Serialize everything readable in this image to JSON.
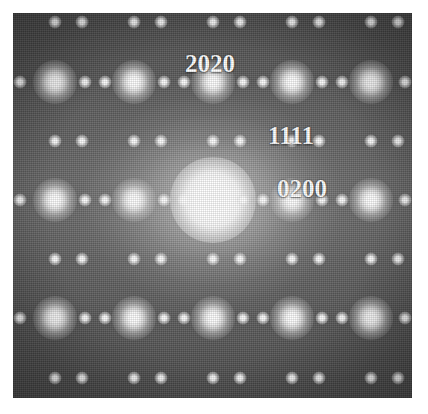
{
  "figure": {
    "kind": "electron-diffraction-pattern",
    "plate": {
      "left": 13,
      "top": 13,
      "width": 399,
      "height": 385,
      "background_color": "#4b4b4b",
      "spot_color": "#ffffff",
      "border_color": "#ffffff"
    },
    "center_beam": {
      "x": 200,
      "y": 187,
      "label": "transmitted-beam"
    }
  },
  "labels": [
    {
      "text": "2020",
      "x": 197,
      "y": 50
    },
    {
      "text": "1111",
      "x": 278,
      "y": 122
    },
    {
      "text": "0200",
      "x": 289,
      "y": 175
    }
  ],
  "chart_data": {
    "type": "scatter",
    "title": "",
    "xlabel": "",
    "ylabel": "",
    "grid": false,
    "legend": "none",
    "note": "Reciprocal-lattice reflections. Coordinates are plate-relative pixels; 'size' encodes relative spot intensity.",
    "row_spacing": 59,
    "column_spacing": 79,
    "spots": [
      {
        "x": 42,
        "y": 9,
        "size": "sm"
      },
      {
        "x": 69,
        "y": 9,
        "size": "sm"
      },
      {
        "x": 121,
        "y": 9,
        "size": "sm"
      },
      {
        "x": 148,
        "y": 9,
        "size": "sm"
      },
      {
        "x": 200,
        "y": 9,
        "size": "sm"
      },
      {
        "x": 227,
        "y": 9,
        "size": "sm"
      },
      {
        "x": 279,
        "y": 9,
        "size": "sm"
      },
      {
        "x": 306,
        "y": 9,
        "size": "sm"
      },
      {
        "x": 358,
        "y": 9,
        "size": "sm"
      },
      {
        "x": 385,
        "y": 9,
        "size": "sm"
      },
      {
        "x": 7,
        "y": 69,
        "size": "sm"
      },
      {
        "x": 42,
        "y": 69,
        "size": "lg"
      },
      {
        "x": 72,
        "y": 69,
        "size": "sm"
      },
      {
        "x": 92,
        "y": 69,
        "size": "sm"
      },
      {
        "x": 121,
        "y": 69,
        "size": "lg"
      },
      {
        "x": 151,
        "y": 69,
        "size": "sm"
      },
      {
        "x": 171,
        "y": 69,
        "size": "sm"
      },
      {
        "x": 200,
        "y": 69,
        "size": "lg"
      },
      {
        "x": 230,
        "y": 69,
        "size": "sm"
      },
      {
        "x": 250,
        "y": 69,
        "size": "sm"
      },
      {
        "x": 279,
        "y": 69,
        "size": "lg"
      },
      {
        "x": 309,
        "y": 69,
        "size": "sm"
      },
      {
        "x": 329,
        "y": 69,
        "size": "sm"
      },
      {
        "x": 358,
        "y": 69,
        "size": "lg"
      },
      {
        "x": 392,
        "y": 69,
        "size": "sm"
      },
      {
        "x": 42,
        "y": 128,
        "size": "sm"
      },
      {
        "x": 69,
        "y": 128,
        "size": "sm"
      },
      {
        "x": 121,
        "y": 128,
        "size": "sm"
      },
      {
        "x": 148,
        "y": 128,
        "size": "sm"
      },
      {
        "x": 200,
        "y": 128,
        "size": "sm"
      },
      {
        "x": 227,
        "y": 128,
        "size": "sm"
      },
      {
        "x": 279,
        "y": 128,
        "size": "sm"
      },
      {
        "x": 306,
        "y": 128,
        "size": "sm"
      },
      {
        "x": 358,
        "y": 128,
        "size": "sm"
      },
      {
        "x": 385,
        "y": 128,
        "size": "sm"
      },
      {
        "x": 7,
        "y": 187,
        "size": "sm"
      },
      {
        "x": 42,
        "y": 187,
        "size": "lg"
      },
      {
        "x": 72,
        "y": 187,
        "size": "sm"
      },
      {
        "x": 92,
        "y": 187,
        "size": "sm"
      },
      {
        "x": 121,
        "y": 187,
        "size": "lg"
      },
      {
        "x": 151,
        "y": 187,
        "size": "sm"
      },
      {
        "x": 171,
        "y": 187,
        "size": "sm"
      },
      {
        "x": 200,
        "y": 187,
        "size": "beam"
      },
      {
        "x": 230,
        "y": 187,
        "size": "sm"
      },
      {
        "x": 250,
        "y": 187,
        "size": "sm"
      },
      {
        "x": 279,
        "y": 187,
        "size": "lg"
      },
      {
        "x": 309,
        "y": 187,
        "size": "sm"
      },
      {
        "x": 329,
        "y": 187,
        "size": "sm"
      },
      {
        "x": 358,
        "y": 187,
        "size": "lg"
      },
      {
        "x": 392,
        "y": 187,
        "size": "sm"
      },
      {
        "x": 42,
        "y": 246,
        "size": "sm"
      },
      {
        "x": 69,
        "y": 246,
        "size": "sm"
      },
      {
        "x": 121,
        "y": 246,
        "size": "sm"
      },
      {
        "x": 148,
        "y": 246,
        "size": "sm"
      },
      {
        "x": 200,
        "y": 246,
        "size": "sm"
      },
      {
        "x": 227,
        "y": 246,
        "size": "sm"
      },
      {
        "x": 279,
        "y": 246,
        "size": "sm"
      },
      {
        "x": 306,
        "y": 246,
        "size": "sm"
      },
      {
        "x": 358,
        "y": 246,
        "size": "sm"
      },
      {
        "x": 385,
        "y": 246,
        "size": "sm"
      },
      {
        "x": 7,
        "y": 305,
        "size": "sm"
      },
      {
        "x": 42,
        "y": 305,
        "size": "lg"
      },
      {
        "x": 72,
        "y": 305,
        "size": "sm"
      },
      {
        "x": 92,
        "y": 305,
        "size": "sm"
      },
      {
        "x": 121,
        "y": 305,
        "size": "lg"
      },
      {
        "x": 151,
        "y": 305,
        "size": "sm"
      },
      {
        "x": 171,
        "y": 305,
        "size": "sm"
      },
      {
        "x": 200,
        "y": 305,
        "size": "lg"
      },
      {
        "x": 230,
        "y": 305,
        "size": "sm"
      },
      {
        "x": 250,
        "y": 305,
        "size": "sm"
      },
      {
        "x": 279,
        "y": 305,
        "size": "lg"
      },
      {
        "x": 309,
        "y": 305,
        "size": "sm"
      },
      {
        "x": 329,
        "y": 305,
        "size": "sm"
      },
      {
        "x": 358,
        "y": 305,
        "size": "lg"
      },
      {
        "x": 392,
        "y": 305,
        "size": "sm"
      },
      {
        "x": 42,
        "y": 365,
        "size": "sm"
      },
      {
        "x": 69,
        "y": 365,
        "size": "sm"
      },
      {
        "x": 121,
        "y": 365,
        "size": "sm"
      },
      {
        "x": 148,
        "y": 365,
        "size": "sm"
      },
      {
        "x": 200,
        "y": 365,
        "size": "sm"
      },
      {
        "x": 227,
        "y": 365,
        "size": "sm"
      },
      {
        "x": 279,
        "y": 365,
        "size": "sm"
      },
      {
        "x": 306,
        "y": 365,
        "size": "sm"
      },
      {
        "x": 358,
        "y": 365,
        "size": "sm"
      },
      {
        "x": 385,
        "y": 365,
        "size": "sm"
      }
    ]
  }
}
